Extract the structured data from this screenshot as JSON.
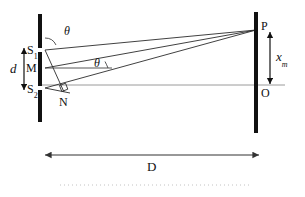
{
  "figure": {
    "kind": "optics-ray-diagram",
    "title_text": "",
    "background_color": "#ffffff",
    "ink_color": "#111111",
    "ray_color": "#333333",
    "axis_color": "#888888",
    "dotted_color": "#b9b9b9"
  },
  "labels": {
    "slit_top": "S",
    "slit_top_sub": "1",
    "slit_mid": "M",
    "slit_bottom": "S",
    "slit_bottom_sub": "2",
    "foot_point": "N",
    "separation": "d",
    "angle_top": "θ",
    "angle_mid": "θ",
    "screen_point": "P",
    "screen_center": "O",
    "fringe_position": "x",
    "fringe_position_sub": "m",
    "screen_distance": "D"
  },
  "geometry": {
    "barrier_left_x": 38,
    "barrier_left_y1": 14,
    "barrier_left_y2": 122,
    "barrier_right_x": 256,
    "barrier_right_y1": 12,
    "barrier_right_y2": 133,
    "slit_top_y": 50,
    "slit_mid_y": 68,
    "slit_bottom_y": 88,
    "point_p_x": 256,
    "point_p_y": 30,
    "point_o_x": 256,
    "point_o_y": 85,
    "point_n_x": 64,
    "point_n_y": 92,
    "axis_y": 85,
    "d_arrow_x": 24,
    "d_arrow_y1": 48,
    "d_arrow_y2": 90,
    "big_d_arrow_y": 155,
    "big_d_arrow_x1": 44,
    "big_d_arrow_x2": 260,
    "xm_arrow_x": 270,
    "xm_arrow_y1": 32,
    "xm_arrow_y2": 84,
    "dotted_y": 185,
    "dotted_x1": 60,
    "dotted_x2": 250
  }
}
